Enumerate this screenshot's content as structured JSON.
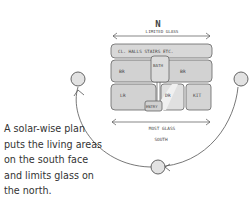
{
  "caption": {
    "lines": [
      "A solar-wise plan",
      "puts the living areas",
      "on the south face",
      "and limits glass on",
      "the north."
    ]
  },
  "diagram": {
    "north_marker": "N",
    "north_label": "LIMITED GLASS",
    "south_glass_label": "MOST GLASS",
    "south_label": "SOUTH",
    "rooms": {
      "service_strip": "CL. HALLS STAIRS ETC.",
      "bedroom_left": "BR",
      "bath": "BATH",
      "bedroom_right": "BR",
      "living_room": "LR",
      "entry": "ENTRY",
      "dining_room": "DR",
      "kitchen": "KIT"
    },
    "colors": {
      "line": "#555555",
      "room_fill": "#d6d6d6",
      "room_fill_light": "#e4e4e4",
      "sun_fill": "#e2e2e2",
      "text": "#333333"
    }
  }
}
